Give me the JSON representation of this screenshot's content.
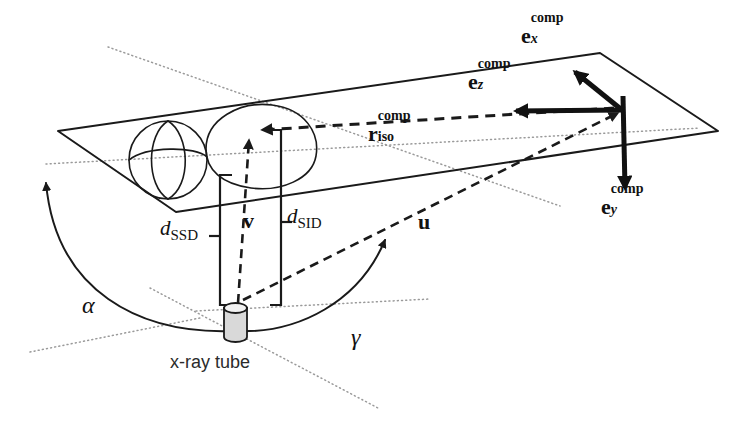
{
  "figure": {
    "kind": "technical-diagram",
    "background_color": "#ffffff",
    "ink_color": "#1a1a1a",
    "guide_color": "#9a9a9a",
    "tube_fill_color": "#d9d9d9"
  },
  "labels": {
    "e_x": {
      "base": "e",
      "sup": "comp",
      "sub": "x"
    },
    "e_y": {
      "base": "e",
      "sup": "comp",
      "sub": "y"
    },
    "e_z": {
      "base": "e",
      "sup": "comp",
      "sub": "z"
    },
    "r_iso": {
      "base": "r",
      "sup": "comp",
      "sub": "iso"
    },
    "v": {
      "base": "v"
    },
    "u": {
      "base": "u"
    },
    "d_ssd": {
      "base": "d",
      "sub": "SSD"
    },
    "d_sid": {
      "base": "d",
      "sub": "SID"
    },
    "alpha": {
      "glyph": "α"
    },
    "gamma": {
      "glyph": "γ"
    },
    "xray_tube": {
      "text": "x-ray tube"
    }
  },
  "elements": {
    "plane": "couch-plane-parallelogram",
    "patient_head": "sphere-with-meridians",
    "patient_body": "ellipse-torso",
    "isocenter": "beam-convergence-point",
    "source": "x-ray-tube-cylinder"
  }
}
